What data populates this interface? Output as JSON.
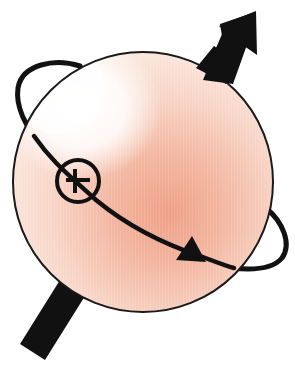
{
  "diagram": {
    "title": "Spinning particle with magnetic moment",
    "canvas": {
      "width": 295,
      "height": 366,
      "background": "#ffffff"
    },
    "sphere": {
      "cx": 143,
      "cy": 182,
      "r": 130,
      "outline_color": "#1a1a1a",
      "highlight_color": "#ffffff",
      "mid_color": "#f6cdbd",
      "shade_color": "#eea58c",
      "edge_color": "#f9e1d6"
    },
    "spin_axis_arrow": {
      "label": "spin axis",
      "color": "#111111",
      "tail": [
        32,
        352
      ],
      "head_tip": [
        255,
        12
      ]
    },
    "orbit": {
      "label": "circulation",
      "color": "#111111",
      "direction_marker": "arrowhead",
      "crossing_symbol": "circle-cross"
    },
    "cross_symbol": {
      "label": "into page",
      "cx": 78,
      "cy": 181,
      "r": 22,
      "color": "#111111"
    }
  }
}
